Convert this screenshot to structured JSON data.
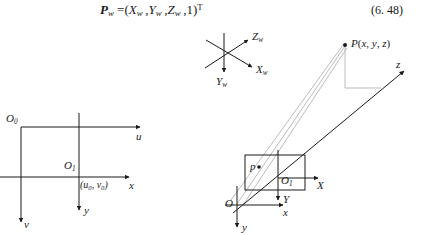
{
  "page": {
    "width": 447,
    "height": 235,
    "background": "#ffffff",
    "ink": "#1a1a1a",
    "ray_color": "#bcbcbc"
  },
  "equation": {
    "lhs": "P",
    "lhs_sub": "w",
    "eq_sign": "=",
    "rhs_text": "(X w , Y w , Z w , 1)",
    "transpose": "T",
    "full_text": "Pw =(Xw ,Yw ,Zw ,1)T",
    "number": "(6. 48)"
  },
  "figure": {
    "image_plane_diagram": {
      "origin_pixel_label": "O",
      "origin_pixel_sub": "0",
      "u_axis_label": "u",
      "v_axis_label": "v",
      "origin_image_label": "O",
      "origin_image_sub": "1",
      "x_axis_label": "x",
      "y_axis_label": "y",
      "principal_point_label": "(u0, v0)"
    },
    "world_frame": {
      "x_axis_label": "X",
      "x_axis_sub": "w",
      "y_axis_label": "Y",
      "y_axis_sub": "w",
      "z_axis_label": "Z",
      "z_axis_sub": "w"
    },
    "camera_frame": {
      "point_world_label": "P(x, y, z)",
      "point_image_label": "p",
      "image_origin_label": "O",
      "image_origin_sub": "1",
      "image_x_label": "X",
      "image_y_label": "Y",
      "camera_origin_label": "O",
      "camera_x_label": "x",
      "camera_y_label": "y",
      "camera_z_label": "z"
    }
  }
}
